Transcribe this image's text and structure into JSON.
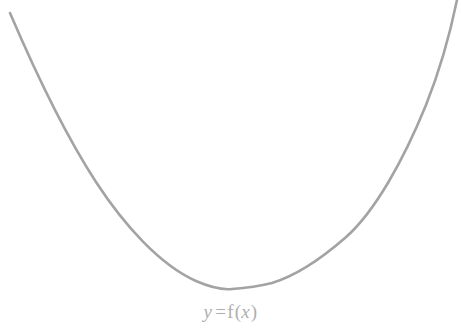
{
  "figure": {
    "name": "parabola-curve-figure",
    "width": 461,
    "height": 335,
    "background_color": "#ffffff",
    "curve_color": "#a3a3a3",
    "curve_stroke_width": 2.6,
    "label_color": "#aeaeae",
    "label_font_size_px": 19
  },
  "label": {
    "full_text": "y = f(x)",
    "y_symbol": "y",
    "equals": "=",
    "f_symbol": "f",
    "open_paren": "(",
    "x_symbol": "x",
    "close_paren": ")",
    "center_x": 233,
    "baseline_y": 320
  },
  "chart_data": {
    "type": "line",
    "title": "",
    "subtitle": "",
    "xlabel": "",
    "ylabel": "",
    "annotations": [
      "y = f(x)"
    ],
    "grid": false,
    "legend": null,
    "axes_visible": false,
    "tick_labels_x": [],
    "tick_labels_y": [],
    "pixel_space": {
      "note": "Sampled pixel coordinates of the drawn curve, origin at top-left of the 461x335 image.",
      "x": [
        10,
        30,
        60,
        90,
        120,
        160,
        200,
        232,
        270,
        310,
        345,
        395,
        430,
        457
      ],
      "y": [
        13,
        60,
        110,
        170,
        212,
        255,
        282,
        289,
        285,
        263,
        243,
        150,
        70,
        0
      ]
    },
    "series": [
      {
        "name": "f(x)",
        "color": "#a3a3a3",
        "vertex": {
          "x": 232,
          "y": 289
        },
        "x_start": 10,
        "x_end": 457,
        "points": [
          [
            10,
            13
          ],
          [
            30,
            60
          ],
          [
            60,
            110
          ],
          [
            90,
            170
          ],
          [
            120,
            212
          ],
          [
            160,
            255
          ],
          [
            200,
            282
          ],
          [
            232,
            289
          ],
          [
            270,
            285
          ],
          [
            310,
            263
          ],
          [
            345,
            243
          ],
          [
            395,
            150
          ],
          [
            430,
            70
          ],
          [
            457,
            0
          ]
        ]
      }
    ]
  }
}
